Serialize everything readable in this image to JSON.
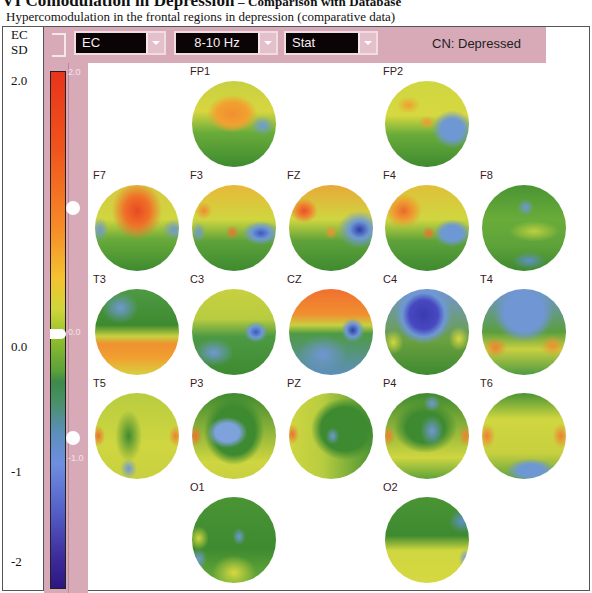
{
  "document": {
    "title_main": "VI Comodulation in Depression",
    "title_dash": " – ",
    "title_tail": "Comparison with Database",
    "subtitle": "Hypercomodulation in the frontal regions in depression (comparative data)"
  },
  "left_column": {
    "header_line1": "EC",
    "header_line2": "SD",
    "labels": [
      "2.0",
      "0.0",
      "-1",
      "-2"
    ]
  },
  "toolbar": {
    "condition_select": "EC",
    "band_select": "8-10 Hz",
    "mode_select": "Stat",
    "comparison_label": "CN: Depressed"
  },
  "color_scale": {
    "ticks": [
      "2.0",
      "0.0",
      "-1.0"
    ],
    "colors": {
      "high": "#e8341c",
      "mid_high": "#f4c230",
      "zero": "#5aa03a",
      "mid_low": "#6e8ee0",
      "low": "#2c1680"
    }
  },
  "maps": [
    {
      "label": "FP1",
      "style": "fp1"
    },
    {
      "label": "FP2",
      "style": "fp2"
    },
    {
      "label": "F7",
      "style": "f7"
    },
    {
      "label": "F3",
      "style": "f3"
    },
    {
      "label": "FZ",
      "style": "fz"
    },
    {
      "label": "F4",
      "style": "f4"
    },
    {
      "label": "F8",
      "style": "f8"
    },
    {
      "label": "T3",
      "style": "t3"
    },
    {
      "label": "C3",
      "style": "c3"
    },
    {
      "label": "CZ",
      "style": "cz"
    },
    {
      "label": "C4",
      "style": "c4"
    },
    {
      "label": "T4",
      "style": "t4"
    },
    {
      "label": "T5",
      "style": "t5"
    },
    {
      "label": "P3",
      "style": "p3"
    },
    {
      "label": "PZ",
      "style": "pz"
    },
    {
      "label": "P4",
      "style": "p4"
    },
    {
      "label": "T6",
      "style": "t6"
    },
    {
      "label": "O1",
      "style": "o1"
    },
    {
      "label": "O2",
      "style": "o2"
    }
  ]
}
